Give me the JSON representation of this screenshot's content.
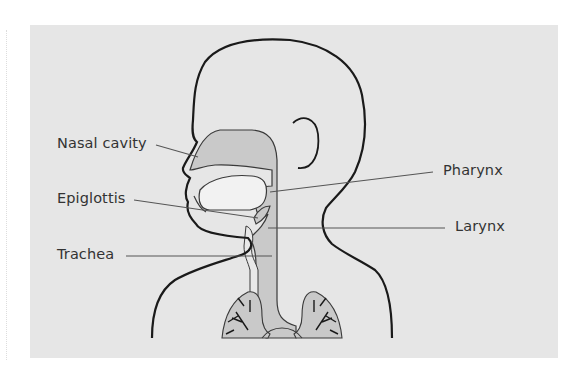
{
  "diagram": {
    "colors": {
      "background": "#ffffff",
      "panel": "#e6e6e6",
      "airway_fill": "#c9c9c9",
      "mouth_fill": "#f2f2f2",
      "outline": "#1a1a1a",
      "leader_line": "#555555",
      "label_text": "#333333"
    },
    "labels": {
      "nasal_cavity": "Nasal cavity",
      "epiglottis": "Epiglottis",
      "trachea": "Trachea",
      "pharynx": "Pharynx",
      "larynx": "Larynx"
    }
  }
}
